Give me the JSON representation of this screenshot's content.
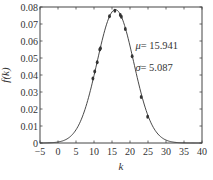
{
  "chart_data": {
    "type": "line",
    "title": "",
    "xlabel": "k",
    "ylabel": "f(k)",
    "xlim": [
      -5,
      40
    ],
    "ylim": [
      0,
      0.08
    ],
    "xticks": [
      -5,
      0,
      5,
      10,
      15,
      20,
      25,
      30,
      35,
      40
    ],
    "yticks": [
      0,
      0.01,
      0.02,
      0.03,
      0.04,
      0.05,
      0.06,
      0.07,
      0.08
    ],
    "xtick_labels": [
      "−5",
      "0",
      "5",
      "10",
      "15",
      "20",
      "25",
      "30",
      "35",
      "40"
    ],
    "ytick_labels": [
      "0",
      "0.01",
      "0.02",
      "0.03",
      "0.04",
      "0.05",
      "0.06",
      "0.07",
      "0.08"
    ],
    "grid": false,
    "legend": null,
    "series": [
      {
        "name": "Normal fit",
        "kind": "curve",
        "distribution": "normal",
        "mu": 15.941,
        "sigma": 5.087,
        "color": "#333333"
      },
      {
        "name": "Observed",
        "kind": "markers",
        "color": "#333333",
        "points": [
          {
            "k": 9.7,
            "f": 0.038
          },
          {
            "k": 10.2,
            "f": 0.042
          },
          {
            "k": 10.9,
            "f": 0.0475
          },
          {
            "k": 11.6,
            "f": 0.055
          },
          {
            "k": 11.8,
            "f": 0.0557
          },
          {
            "k": 14.3,
            "f": 0.0745
          },
          {
            "k": 15.8,
            "f": 0.0778
          },
          {
            "k": 17.3,
            "f": 0.0753
          },
          {
            "k": 17.6,
            "f": 0.0743
          },
          {
            "k": 18.7,
            "f": 0.067
          },
          {
            "k": 20.6,
            "f": 0.051
          },
          {
            "k": 23.1,
            "f": 0.027
          },
          {
            "k": 24.9,
            "f": 0.0155
          }
        ]
      }
    ],
    "annotations": [
      {
        "symbol": "μ",
        "text": "= 15.941",
        "x": 21.5,
        "y": 0.0555
      },
      {
        "symbol": "σ",
        "text": "= 5.087",
        "x": 21.5,
        "y": 0.0425
      }
    ]
  }
}
